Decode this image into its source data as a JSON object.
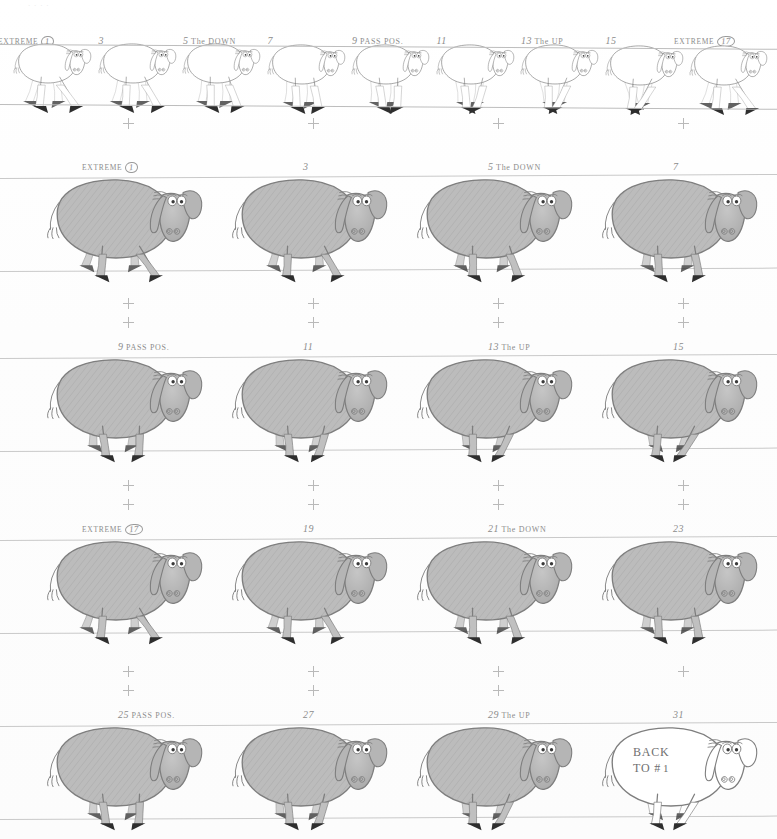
{
  "sheet": {
    "kind": "animation-walk-cycle-model-sheet",
    "character": "sheep",
    "faint_top_mark": "· · · ·",
    "ink_color": "#8c8c8c",
    "body_fill": "#b8b8b8",
    "hoof_color": "#2b2b2b",
    "rule_color": "#c9c9c9"
  },
  "strip": {
    "name": "thumbnail-strip",
    "frame_count": 9,
    "labels": [
      {
        "prefix": "EXTREME",
        "num": "1",
        "circled": true,
        "note": ""
      },
      {
        "prefix": "",
        "num": "3",
        "circled": false,
        "note": ""
      },
      {
        "prefix": "",
        "num": "5",
        "circled": false,
        "note": "The DOWN"
      },
      {
        "prefix": "",
        "num": "7",
        "circled": false,
        "note": ""
      },
      {
        "prefix": "",
        "num": "9",
        "circled": false,
        "note": "PASS POS."
      },
      {
        "prefix": "",
        "num": "11",
        "circled": false,
        "note": ""
      },
      {
        "prefix": "",
        "num": "13",
        "circled": false,
        "note": "The UP"
      },
      {
        "prefix": "",
        "num": "15",
        "circled": false,
        "note": ""
      },
      {
        "prefix": "EXTREME",
        "num": "17",
        "circled": true,
        "note": ""
      }
    ]
  },
  "rows": [
    {
      "name": "row-1",
      "cells": [
        {
          "prefix": "EXTREME",
          "num": "1",
          "circled": true,
          "note": "",
          "crosses": 1,
          "shaded": true,
          "inner_text": "",
          "pose": 1
        },
        {
          "prefix": "",
          "num": "3",
          "circled": false,
          "note": "",
          "crosses": 1,
          "shaded": true,
          "inner_text": "",
          "pose": 2
        },
        {
          "prefix": "",
          "num": "5",
          "circled": false,
          "note": "The DOWN",
          "crosses": 1,
          "shaded": true,
          "inner_text": "",
          "pose": 3
        },
        {
          "prefix": "",
          "num": "7",
          "circled": false,
          "note": "",
          "crosses": 1,
          "shaded": true,
          "inner_text": "",
          "pose": 4
        }
      ]
    },
    {
      "name": "row-2",
      "cells": [
        {
          "prefix": "",
          "num": "9",
          "circled": false,
          "note": "PASS POS.",
          "crosses": 2,
          "shaded": true,
          "inner_text": "",
          "pose": 5
        },
        {
          "prefix": "",
          "num": "11",
          "circled": false,
          "note": "",
          "crosses": 2,
          "shaded": true,
          "inner_text": "",
          "pose": 6
        },
        {
          "prefix": "",
          "num": "13",
          "circled": false,
          "note": "The UP",
          "crosses": 2,
          "shaded": true,
          "inner_text": "",
          "pose": 7
        },
        {
          "prefix": "",
          "num": "15",
          "circled": false,
          "note": "",
          "crosses": 2,
          "shaded": true,
          "inner_text": "",
          "pose": 8
        }
      ]
    },
    {
      "name": "row-3",
      "cells": [
        {
          "prefix": "EXTREME",
          "num": "17",
          "circled": true,
          "note": "",
          "crosses": 2,
          "shaded": true,
          "inner_text": "",
          "pose": 1
        },
        {
          "prefix": "",
          "num": "19",
          "circled": false,
          "note": "",
          "crosses": 2,
          "shaded": true,
          "inner_text": "",
          "pose": 2
        },
        {
          "prefix": "",
          "num": "21",
          "circled": false,
          "note": "The DOWN",
          "crosses": 2,
          "shaded": true,
          "inner_text": "",
          "pose": 3
        },
        {
          "prefix": "",
          "num": "23",
          "circled": false,
          "note": "",
          "crosses": 2,
          "shaded": true,
          "inner_text": "",
          "pose": 4
        }
      ]
    },
    {
      "name": "row-4",
      "cells": [
        {
          "prefix": "",
          "num": "25",
          "circled": false,
          "note": "PASS POS.",
          "crosses": 2,
          "shaded": true,
          "inner_text": "",
          "pose": 5
        },
        {
          "prefix": "",
          "num": "27",
          "circled": false,
          "note": "",
          "crosses": 2,
          "shaded": true,
          "inner_text": "",
          "pose": 6
        },
        {
          "prefix": "",
          "num": "29",
          "circled": false,
          "note": "The UP",
          "crosses": 2,
          "shaded": true,
          "inner_text": "",
          "pose": 7
        },
        {
          "prefix": "",
          "num": "31",
          "circled": false,
          "note": "",
          "crosses": 1,
          "shaded": false,
          "inner_text": "BACK TO #1",
          "pose": 8
        }
      ]
    }
  ],
  "final_note": {
    "line1": "BACK",
    "line2": "TO #",
    "circled_num": "1"
  }
}
